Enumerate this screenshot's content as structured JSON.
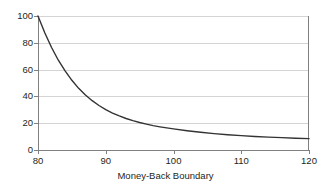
{
  "chart_data": {
    "type": "line",
    "title": "",
    "subtitle": "",
    "xlabel": "Money-Back Boundary",
    "ylabel": "",
    "xlim": [
      80,
      120
    ],
    "ylim": [
      0,
      100
    ],
    "xticks": [
      80,
      90,
      100,
      110,
      120
    ],
    "yticks": [
      0,
      20,
      40,
      60,
      80,
      100
    ],
    "xtick_labels": [
      "80",
      "90",
      "100",
      "110",
      "120"
    ],
    "ytick_labels": [
      "0",
      "20",
      "40",
      "60",
      "80",
      "100"
    ],
    "grid": "horizontal",
    "legend": "none",
    "annotations": [],
    "series": [
      {
        "name": "",
        "color": "#333333",
        "x": [
          80,
          81,
          82,
          83,
          84,
          85,
          86,
          87,
          88,
          89,
          90,
          91,
          92,
          93,
          94,
          95,
          96,
          97,
          98,
          99,
          100,
          102,
          104,
          106,
          108,
          110,
          112,
          114,
          116,
          118,
          120
        ],
        "values": [
          100,
          87.5,
          76.5,
          67.0,
          59.0,
          52.0,
          46.0,
          41.0,
          36.8,
          33.2,
          30.2,
          27.6,
          25.4,
          23.5,
          21.9,
          20.5,
          19.3,
          18.2,
          17.3,
          16.5,
          15.8,
          14.4,
          13.2,
          12.2,
          11.4,
          10.7,
          10.1,
          9.6,
          9.2,
          8.8,
          8.5
        ]
      }
    ]
  },
  "style": {
    "axis_color": "#808080",
    "grid_color": "#d4d4d4",
    "curve_color": "#333333",
    "text_color": "#231f20",
    "background": "#ffffff"
  },
  "geometry": {
    "plot_left": 38,
    "plot_right": 309,
    "plot_top": 16,
    "plot_bottom": 150
  }
}
